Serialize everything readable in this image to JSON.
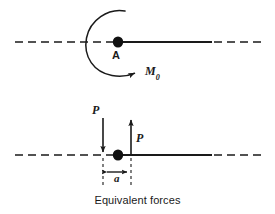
{
  "figure": {
    "caption": "Equivalent forces",
    "stroke_color": "#1a1a1a",
    "background_color": "#ffffff",
    "top_diagram": {
      "point_label": "A",
      "moment_label_base": "M",
      "moment_label_sub": "0",
      "axis_y": 42,
      "point_x": 118,
      "axis_left_dash_start": 15,
      "axis_solid_end": 212,
      "axis_right_dash_end": 265,
      "arc_center_x": 122,
      "arc_center_y": 42,
      "arc_radius": 36,
      "arrow_direction": "clockwise-moment"
    },
    "bottom_diagram": {
      "force_label_up": "P",
      "force_label_down": "P",
      "dimension_label": "a",
      "axis_y": 155,
      "point_x": 118,
      "down_arrow_x": 103,
      "up_arrow_x": 131,
      "down_arrow_top_y": 118,
      "up_arrow_top_y": 118,
      "dimension_y": 172,
      "axis_left_dash_start": 15,
      "axis_solid_end": 212,
      "axis_right_dash_end": 265
    }
  }
}
